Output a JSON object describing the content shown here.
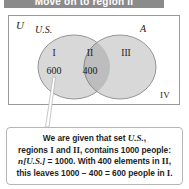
{
  "banner": {
    "title": "Move on to region II"
  },
  "diagram": {
    "universe_label": "U",
    "set_left_label": "U.S.",
    "set_right_label": "A",
    "regions": [
      {
        "numeral": "I",
        "count": "600"
      },
      {
        "numeral": "II",
        "count": "400"
      },
      {
        "numeral": "III",
        "count": ""
      },
      {
        "numeral": "IV",
        "count": ""
      }
    ],
    "colors": {
      "circle_fill": "#d8d8d8",
      "overlap_fill": "#bdbdbd",
      "circle_stroke": "#8a8a8a",
      "box_stroke": "#9a9a9a",
      "banner_bg": "#8b8b8b",
      "text": "#1a1a1a"
    }
  },
  "caption": {
    "line1_a": "We are given that set ",
    "line1_b": "U.S.",
    "line1_c": ",",
    "line2_a": "regions ",
    "line2_I": "I",
    "line2_b": " and ",
    "line2_II": "II",
    "line2_c": ", contains 1000 people:",
    "line3_a": "n",
    "line3_b": "[U.S.]",
    "line3_c": " = 1000. With 400 elements in ",
    "line3_II": "II",
    "line3_d": ",",
    "line4_a": "this leaves 1000 − 400 = 600 people in ",
    "line4_I": "I",
    "line4_b": "."
  }
}
